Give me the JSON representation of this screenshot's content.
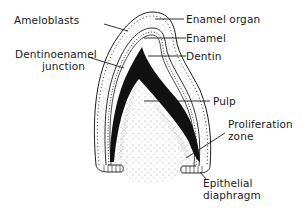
{
  "diagram": {
    "labels": {
      "ameloblasts": "Ameloblasts",
      "dej_line1": "Dentinoenamel",
      "dej_line2": "junction",
      "enamel_organ": "Enamel organ",
      "enamel": "Enamel",
      "dentin": "Dentin",
      "pulp": "Pulp",
      "prolif_line1": "Proliferation",
      "prolif_line2": "zone",
      "epi_line1": "Epithelial",
      "epi_line2": "diaphragm"
    },
    "colors": {
      "ink": "#1a1a1a",
      "background": "#ffffff",
      "dentin_fill": "#111111"
    }
  }
}
